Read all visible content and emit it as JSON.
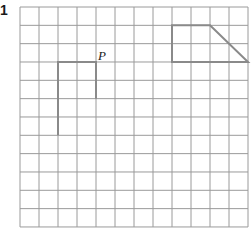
{
  "question_number": "1",
  "point_label": "P",
  "grid": {
    "cols": 12,
    "rows": 12,
    "x0": 20,
    "y0": 7,
    "cell_w": 19,
    "cell_h": 18.33,
    "line_color": "#9a9a9a"
  },
  "shapes": [
    {
      "name": "shape-left",
      "points": [
        [
          2,
          7
        ],
        [
          2,
          3
        ],
        [
          4,
          3
        ],
        [
          4,
          5
        ]
      ],
      "color": "#8a8a8a"
    },
    {
      "name": "shape-right",
      "points": [
        [
          8,
          1
        ],
        [
          10,
          1
        ],
        [
          12,
          3
        ],
        [
          8,
          3
        ]
      ],
      "closed": true,
      "color": "#8a8a8a"
    }
  ]
}
